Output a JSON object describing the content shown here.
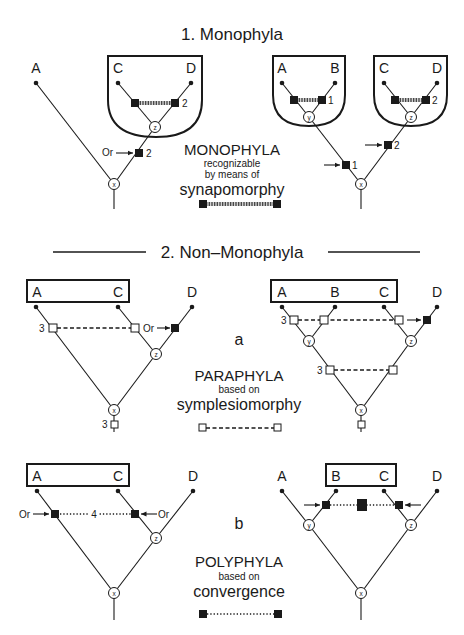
{
  "section1": {
    "title": "1. Monophyla",
    "left_tree": {
      "taxa": [
        "A",
        "C",
        "D"
      ],
      "char_label": "2",
      "or_label": "Or",
      "marker_label": "2",
      "nodes": {
        "x": "x",
        "z": "z"
      }
    },
    "right_tree": {
      "taxa": [
        "A",
        "B",
        "C",
        "D"
      ],
      "char_labels": [
        "1",
        "2"
      ],
      "marker_labels": [
        "1",
        "2"
      ],
      "nodes": {
        "x": "x",
        "y": "y",
        "z": "z"
      }
    },
    "legend": {
      "title": "MONOPHYLA",
      "line1": "recognizable",
      "line2": "by means of",
      "term": "synapomorphy"
    }
  },
  "section2": {
    "title": "2. Non–Monophyla",
    "a": {
      "letter": "a",
      "left_tree": {
        "taxa": [
          "A",
          "C",
          "D"
        ],
        "char_label": "3",
        "or_label": "Or",
        "root_label": "3",
        "nodes": {
          "x": "x",
          "z": "z"
        }
      },
      "right_tree": {
        "taxa": [
          "A",
          "B",
          "C",
          "D"
        ],
        "char_labels": [
          "3",
          "3"
        ],
        "nodes": {
          "x": "x",
          "y": "y",
          "z": "z"
        }
      },
      "legend": {
        "title": "PARAPHYLA",
        "line1": "based on",
        "term": "symplesiomorphy"
      }
    },
    "b": {
      "letter": "b",
      "left_tree": {
        "taxa": [
          "A",
          "C",
          "D"
        ],
        "char_label": "4",
        "or_labels": [
          "Or",
          "Or"
        ],
        "nodes": {
          "x": "x",
          "z": "z"
        }
      },
      "right_tree": {
        "taxa": [
          "A",
          "B",
          "C",
          "D"
        ],
        "char_label": "5",
        "nodes": {
          "x": "x",
          "y": "y",
          "z": "z"
        }
      },
      "legend": {
        "title": "POLYPHYLA",
        "line1": "based on",
        "term": "convergence"
      }
    }
  }
}
